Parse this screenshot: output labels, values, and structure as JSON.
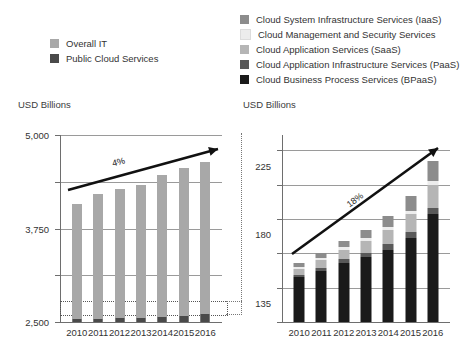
{
  "colors": {
    "overall_it": "#a8a8a8",
    "public_cloud": "#4a4a4a",
    "iaas": "#8c8c8c",
    "mgmt_security": "#ececec",
    "saas": "#b5b5b5",
    "paas": "#595959",
    "bpaas": "#1a1a1a",
    "gridline": "#9a9a9a",
    "axis": "#6e6e6e",
    "arrow": "#111111",
    "text": "#333333"
  },
  "legend_left": {
    "items": [
      {
        "label": "Overall IT",
        "color": "#a8a8a8",
        "swatch": "overall-it-swatch"
      },
      {
        "label": "Public Cloud Services",
        "color": "#4a4a4a",
        "swatch": "public-cloud-swatch"
      }
    ]
  },
  "legend_right": {
    "items": [
      {
        "label": "Cloud System Infrastructure Services (IaaS)",
        "color": "#8c8c8c",
        "swatch": "iaas-swatch"
      },
      {
        "label": "Cloud Management and Security Services",
        "color": "#ececec",
        "swatch": "management-security-swatch"
      },
      {
        "label": "Cloud Application Services (SaaS)",
        "color": "#b5b5b5",
        "swatch": "saas-swatch"
      },
      {
        "label": "Cloud Application Infrastructure Services (PaaS)",
        "color": "#595959",
        "swatch": "paas-swatch"
      },
      {
        "label": "Cloud Business Process Services (BPaaS)",
        "color": "#1a1a1a",
        "swatch": "bpaas-swatch"
      }
    ]
  },
  "chart_data": [
    {
      "id": "overall-it-chart",
      "type": "bar",
      "title": "",
      "ylabel": "USD Billions",
      "xlabel": "",
      "categories": [
        "2010",
        "2011",
        "2012",
        "2013",
        "2014",
        "2015",
        "2016"
      ],
      "yticks": [
        "0",
        "1,250",
        "2,500",
        "3,750",
        "5,000"
      ],
      "ytick_values": [
        0,
        1250,
        2500,
        3750,
        5000
      ],
      "ylim": [
        0,
        5000
      ],
      "grid": true,
      "legend_position": "above-left",
      "series": [
        {
          "name": "Overall IT",
          "color": "#a8a8a8",
          "values": [
            3150,
            3430,
            3560,
            3660,
            3940,
            4110,
            4280
          ]
        },
        {
          "name": "Public Cloud Services",
          "color": "#4a4a4a",
          "values": [
            77,
            88,
            100,
            112,
            132,
            155,
            204
          ]
        }
      ],
      "annotation": {
        "label": "4%",
        "type": "growth-arrow",
        "from_year": "2010",
        "to_year": "2016"
      }
    },
    {
      "id": "public-cloud-chart",
      "type": "bar",
      "stacked": true,
      "title": "",
      "ylabel": "USD Billions",
      "xlabel": "",
      "categories": [
        "2010",
        "2011",
        "2012",
        "2013",
        "2014",
        "2015",
        "2016"
      ],
      "yticks": [
        "0",
        "45",
        "90",
        "135",
        "180",
        "225"
      ],
      "ytick_values": [
        0,
        45,
        90,
        135,
        180,
        225
      ],
      "ylim": [
        0,
        245
      ],
      "grid": true,
      "legend_position": "above-right",
      "series": [
        {
          "name": "Cloud Business Process Services (BPaaS)",
          "color": "#1a1a1a",
          "values": [
            59,
            67,
            77,
            85,
            95,
            110,
            141
          ]
        },
        {
          "name": "Cloud Application Infrastructure Services (PaaS)",
          "color": "#595959",
          "values": [
            3,
            4,
            5,
            6,
            7,
            8,
            9
          ]
        },
        {
          "name": "Cloud Application Services (SaaS)",
          "color": "#b5b5b5",
          "values": [
            8,
            10,
            13,
            15,
            19,
            23,
            29
          ]
        },
        {
          "name": "Cloud Management and Security Services",
          "color": "#ececec",
          "values": [
            2,
            3,
            3,
            4,
            4,
            5,
            6
          ]
        },
        {
          "name": "Cloud System Infrastructure Services (IaaS)",
          "color": "#8c8c8c",
          "values": [
            5,
            6,
            8,
            10,
            14,
            19,
            26
          ]
        }
      ],
      "annotation": {
        "label": "18%",
        "type": "growth-arrow",
        "from_year": "2010",
        "to_year": "2016"
      }
    }
  ],
  "captions": {
    "left_axis_title": "USD Billions",
    "right_axis_title": "USD Billions"
  }
}
